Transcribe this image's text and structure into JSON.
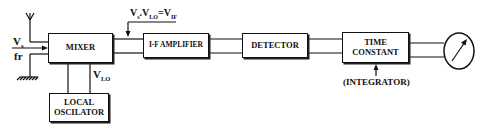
{
  "diagram": {
    "type": "block-diagram",
    "blocks": {
      "mixer": {
        "label": "MIXER"
      },
      "local_oscillator": {
        "line1": "LOCAL",
        "line2": "OSCILATOR"
      },
      "if_amplifier": {
        "label": "I-F AMPLIFIER"
      },
      "detector": {
        "label": "DETECTOR"
      },
      "time_constant": {
        "line1": "TIME",
        "line2": "CONSTANT"
      }
    },
    "inputs": {
      "signal": {
        "main": "V",
        "sub": "s"
      },
      "frequency": "fr"
    },
    "annotations": {
      "vlo": {
        "main": "V",
        "sub": "LO"
      },
      "mixer_output": {
        "v1": "V",
        "s1": "s",
        "dot": ".",
        "v2": "V",
        "s2": "LO",
        "eq": "=",
        "v3": "V",
        "s3": "IF"
      },
      "integrator": "(INTEGRATOR)"
    },
    "output_device": "meter",
    "colors": {
      "line": "#111111",
      "background": "#ffffff"
    }
  }
}
